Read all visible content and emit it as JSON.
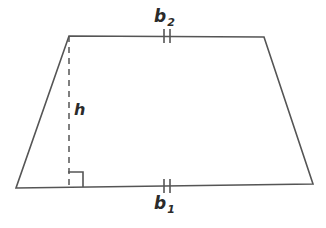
{
  "figure": {
    "name": "trapezoid-with-height",
    "background_color": "#ffffff",
    "stroke_color": "#555555",
    "text_color": "#2b2b2b"
  },
  "labels": {
    "top_base": {
      "letter": "b",
      "subscript": "2",
      "full": "b₂"
    },
    "bottom_base": {
      "letter": "b",
      "subscript": "1",
      "full": "b₁"
    },
    "height": {
      "letter": "h",
      "full": "h"
    }
  },
  "geometry": {
    "vertices": {
      "top_left": [
        69,
        36
      ],
      "top_right": [
        264,
        37
      ],
      "bottom_right": [
        313,
        184
      ],
      "bottom_left": [
        16,
        188
      ]
    },
    "height_segment": {
      "from": [
        69,
        36
      ],
      "to": [
        69,
        187
      ],
      "style": "dashed"
    },
    "right_angle_marker": {
      "x": 68,
      "y": 172,
      "size": 15
    },
    "tick_marks": {
      "top_base": {
        "count": 2,
        "center_x": 167,
        "center_y": 36,
        "length": 13,
        "gap": 5
      },
      "bottom_base": {
        "count": 2,
        "center_x": 167,
        "center_y": 186,
        "length": 13,
        "gap": 5
      }
    }
  }
}
